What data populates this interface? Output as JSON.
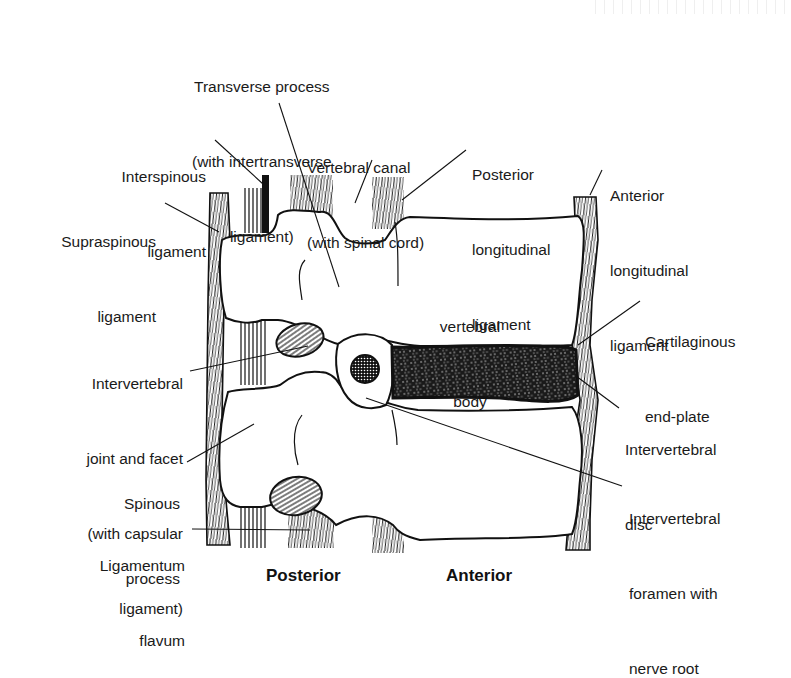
{
  "diagram": {
    "orientation": {
      "posterior": "Posterior",
      "anterior": "Anterior"
    },
    "labels": {
      "transverse_process": [
        "Transverse process",
        "(with intertransverse",
        "ligament)"
      ],
      "vertebral_canal": [
        "Vertebral canal",
        "(with spinal cord)"
      ],
      "posterior_longitudinal": [
        "Posterior",
        "longitudinal",
        "ligament"
      ],
      "anterior_longitudinal": [
        "Anterior",
        "longitudinal",
        "ligament"
      ],
      "interspinous": [
        "Interspinous",
        "ligament"
      ],
      "supraspinous": [
        "Supraspinous",
        "ligament"
      ],
      "vertebral_body": [
        "vertebral",
        "body"
      ],
      "cartilaginous_endplate": [
        "Cartilaginous",
        "end-plate"
      ],
      "intervertebral_joint": [
        "Intervertebral",
        "joint and facet",
        "(with capsular",
        "ligament)"
      ],
      "intervertebral_disc": [
        "Intervertebral",
        "disc"
      ],
      "spinous_process": [
        "Spinous",
        "process"
      ],
      "intervertebral_foramen": [
        "Intervertebral",
        "foramen with",
        "nerve root"
      ],
      "ligamentum_flavum": [
        "Ligamentum",
        "flavum"
      ]
    },
    "colors": {
      "ink": "#111111",
      "background": "#ffffff",
      "bone": "#ffffff"
    }
  }
}
